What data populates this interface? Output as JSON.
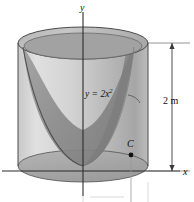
{
  "figure": {
    "kind": "engineering-diagram",
    "axes": {
      "y_label": "y",
      "x_label": "x"
    },
    "curve": {
      "equation_lhs": "y",
      "equation_rel": " = ",
      "equation_coeff": "2",
      "equation_var": "x",
      "equation_exponent": "2",
      "equation_full": "y = 2x²"
    },
    "dimension": {
      "height_label": "2 m",
      "value": 2,
      "unit": "m"
    },
    "point": {
      "label": "C"
    },
    "colors": {
      "outline": "#3a3a3a",
      "body_light": "#d8d8d8",
      "body_mid": "#bdbdbd",
      "body_dark": "#8f8f8f",
      "rim_dark": "#9a9a9a",
      "curve": "#555555",
      "axis": "#2b2b2b",
      "text": "#111111",
      "background": "#ffffff"
    }
  }
}
